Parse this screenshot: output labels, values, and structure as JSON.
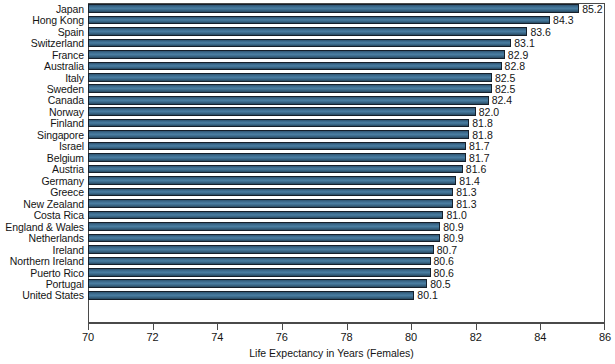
{
  "chart_data": {
    "type": "bar",
    "orientation": "horizontal",
    "title": "",
    "xlabel": "Life Expectancy in Years (Females)",
    "ylabel": "",
    "xlim": [
      70,
      86
    ],
    "xticks": [
      70,
      72,
      74,
      76,
      78,
      80,
      82,
      84,
      86
    ],
    "xtick_labels": [
      "70",
      "72",
      "74",
      "76",
      "78",
      "80",
      "82",
      "84",
      "86"
    ],
    "grid": false,
    "legend": false,
    "bar_color": "#3c6a8c",
    "bar_edge_color": "#16202b",
    "background_color": "#ffffff",
    "categories": [
      "Japan",
      "Hong Kong",
      "Spain",
      "Switzerland",
      "France",
      "Australia",
      "Italy",
      "Sweden",
      "Canada",
      "Norway",
      "Finland",
      "Singapore",
      "Israel",
      "Belgium",
      "Austria",
      "Germany",
      "Greece",
      "New Zealand",
      "Costa Rica",
      "England & Wales",
      "Netherlands",
      "Ireland",
      "Northern Ireland",
      "Puerto Rico",
      "Portugal",
      "United States"
    ],
    "values": [
      85.2,
      84.3,
      83.6,
      83.1,
      82.9,
      82.8,
      82.5,
      82.5,
      82.4,
      82.0,
      81.8,
      81.8,
      81.7,
      81.7,
      81.6,
      81.4,
      81.3,
      81.3,
      81.0,
      80.9,
      80.9,
      80.7,
      80.6,
      80.6,
      80.5,
      80.1
    ],
    "value_labels": [
      "85.2",
      "84.3",
      "83.6",
      "83.1",
      "82.9",
      "82.8",
      "82.5",
      "82.5",
      "82.4",
      "82.0",
      "81.8",
      "81.8",
      "81.7",
      "81.7",
      "81.6",
      "81.4",
      "81.3",
      "81.3",
      "81.0",
      "80.9",
      "80.9",
      "80.7",
      "80.6",
      "80.6",
      "80.5",
      "80.1"
    ]
  }
}
